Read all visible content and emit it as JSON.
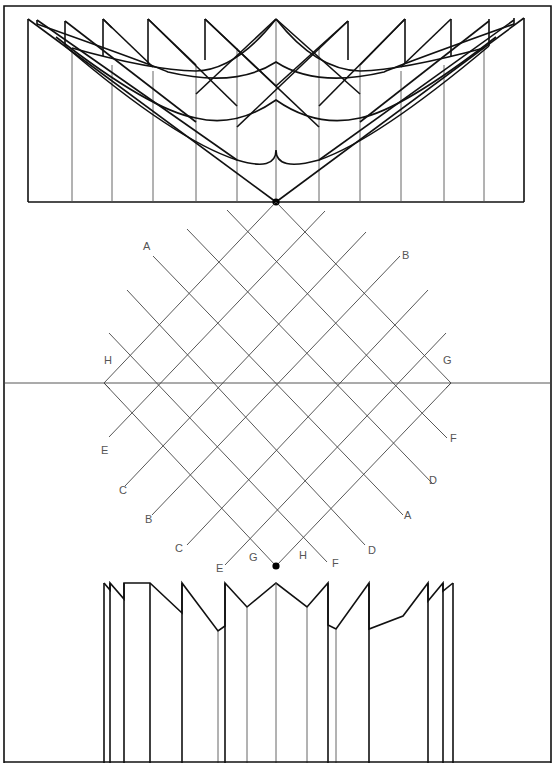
{
  "figure": {
    "title": "",
    "width": 556,
    "height": 763,
    "colors": {
      "ink": "#111111",
      "grid": "#444444",
      "label": "#555555",
      "background": "#ffffff"
    }
  },
  "frame": {
    "x1": 4,
    "y1": 6,
    "x2": 551,
    "y2": 763
  },
  "top_panel": {
    "box": {
      "x1": 28,
      "y1": 202,
      "x2": 524
    },
    "pivot_dot": {
      "x": 276,
      "y": 202
    },
    "vertical_folds_x": [
      28,
      72,
      112,
      153,
      196,
      237,
      276,
      319,
      360,
      401,
      444,
      484,
      524
    ],
    "sawtooth_tops": [
      {
        "x": 28,
        "y": 19
      },
      {
        "x": 37,
        "y": 19
      },
      {
        "x": 65,
        "y": 21
      },
      {
        "x": 103,
        "y": 19
      },
      {
        "x": 148,
        "y": 19
      },
      {
        "x": 205,
        "y": 19
      },
      {
        "x": 276,
        "y": 19
      },
      {
        "x": 348,
        "y": 21
      },
      {
        "x": 405,
        "y": 19
      },
      {
        "x": 451,
        "y": 19
      },
      {
        "x": 489,
        "y": 19
      },
      {
        "x": 514,
        "y": 19
      },
      {
        "x": 524,
        "y": 18
      }
    ]
  },
  "lattice": {
    "apex": {
      "x": 276,
      "y": 202
    },
    "left_vertex": {
      "x": 104,
      "y": 383,
      "label": "H"
    },
    "right_vertex": {
      "x": 451,
      "y": 383,
      "label": "G"
    },
    "bottom_dot": {
      "x": 276,
      "y": 566
    },
    "horizon_line": {
      "y": 383,
      "x1": 4,
      "x2": 551
    },
    "cells": 6,
    "labels": [
      {
        "text": "A",
        "x": 143,
        "y": 250
      },
      {
        "text": "B",
        "x": 402,
        "y": 259
      },
      {
        "text": "H",
        "x": 104,
        "y": 364
      },
      {
        "text": "G",
        "x": 443,
        "y": 364
      },
      {
        "text": "E",
        "x": 101,
        "y": 454
      },
      {
        "text": "F",
        "x": 450,
        "y": 442
      },
      {
        "text": "C",
        "x": 119,
        "y": 494
      },
      {
        "text": "D",
        "x": 429,
        "y": 484
      },
      {
        "text": "B",
        "x": 145,
        "y": 523
      },
      {
        "text": "A",
        "x": 404,
        "y": 519
      },
      {
        "text": "C",
        "x": 175,
        "y": 552
      },
      {
        "text": "D",
        "x": 368,
        "y": 554
      },
      {
        "text": "E",
        "x": 216,
        "y": 572
      },
      {
        "text": "G",
        "x": 249,
        "y": 561
      },
      {
        "text": "H",
        "x": 299,
        "y": 559
      },
      {
        "text": "F",
        "x": 332,
        "y": 567
      }
    ]
  },
  "bottom_panel": {
    "base_y": 763,
    "folds": [
      {
        "x": 104,
        "top": 583
      },
      {
        "x": 110,
        "top": 590
      },
      {
        "x": 124,
        "top": 599
      },
      {
        "x": 150,
        "top": 583
      },
      {
        "x": 182,
        "top": 583
      },
      {
        "x": 218,
        "top": 631
      },
      {
        "x": 225,
        "top": 583
      },
      {
        "x": 247,
        "top": 607
      },
      {
        "x": 276,
        "top": 583
      },
      {
        "x": 307,
        "top": 607
      },
      {
        "x": 328,
        "top": 583
      },
      {
        "x": 336,
        "top": 629
      },
      {
        "x": 369,
        "top": 583
      },
      {
        "x": 403,
        "top": 616
      },
      {
        "x": 428,
        "top": 583
      },
      {
        "x": 443,
        "top": 583
      },
      {
        "x": 453,
        "top": 583
      }
    ]
  }
}
